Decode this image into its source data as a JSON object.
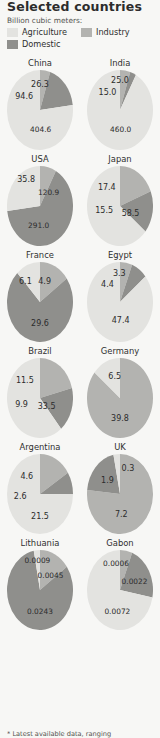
{
  "header": {
    "title": "Selected countries",
    "units_label": "Billion cubic meters:"
  },
  "legend": {
    "items": [
      {
        "label": "Agriculture",
        "key": "agriculture",
        "color": "#e3e3e0"
      },
      {
        "label": "Industry",
        "key": "industry",
        "color": "#b3b3b0"
      },
      {
        "label": "Domestic",
        "key": "domestic",
        "color": "#8f8f8c"
      }
    ]
  },
  "footnote": {
    "text": "* Latest available data, ranging"
  },
  "colors": {
    "background": "#f7f7f5",
    "agriculture": "#e3e3e0",
    "industry": "#b3b3b0",
    "domestic": "#8f8f8c",
    "text": "#2c2c2c"
  },
  "chart_data": {
    "type": "pie",
    "title": "Selected countries",
    "unit": "Billion cubic meters",
    "categories": [
      "Agriculture",
      "Industry",
      "Domestic"
    ],
    "legend_position": "top",
    "charts": [
      {
        "name": "China",
        "labels": [
          {
            "text": "26.3",
            "series": "industry",
            "x": 50,
            "y": 17
          },
          {
            "text": "94.6",
            "series": "domestic",
            "x": 26,
            "y": 33
          },
          {
            "text": "404.6",
            "series": "agriculture",
            "x": 51,
            "y": 74
          }
        ],
        "values": {
          "agriculture": 404.6,
          "industry": 26.3,
          "domestic": 94.6
        }
      },
      {
        "name": "India",
        "labels": [
          {
            "text": "25.0",
            "series": "industry",
            "x": 50,
            "y": 13
          },
          {
            "text": "15.0",
            "series": "domestic",
            "x": 31,
            "y": 28
          },
          {
            "text": "460.0",
            "series": "agriculture",
            "x": 51,
            "y": 74
          }
        ],
        "values": {
          "agriculture": 460.0,
          "industry": 25.0,
          "domestic": 15.0
        }
      },
      {
        "name": "USA",
        "labels": [
          {
            "text": "35.8",
            "series": "industry",
            "x": 29,
            "y": 16
          },
          {
            "text": "120.9",
            "series": "agriculture",
            "x": 63,
            "y": 33
          },
          {
            "text": "291.0",
            "series": "domestic",
            "x": 48,
            "y": 74
          }
        ],
        "values": {
          "agriculture": 120.9,
          "industry": 35.8,
          "domestic": 291.0
        }
      },
      {
        "name": "Japan",
        "labels": [
          {
            "text": "17.4",
            "series": "industry",
            "x": 30,
            "y": 26
          },
          {
            "text": "15.5",
            "series": "domestic",
            "x": 26,
            "y": 55
          },
          {
            "text": "58.5",
            "series": "agriculture",
            "x": 66,
            "y": 59
          }
        ],
        "values": {
          "agriculture": 58.5,
          "industry": 17.4,
          "domestic": 15.5
        }
      },
      {
        "name": "France",
        "labels": [
          {
            "text": "6.1",
            "series": "industry",
            "x": 28,
            "y": 24
          },
          {
            "text": "4.9",
            "series": "agriculture",
            "x": 57,
            "y": 24
          },
          {
            "text": "29.6",
            "series": "domestic",
            "x": 50,
            "y": 76
          }
        ],
        "values": {
          "agriculture": 4.9,
          "industry": 6.1,
          "domestic": 29.6
        }
      },
      {
        "name": "Egypt",
        "labels": [
          {
            "text": "3.3",
            "series": "industry",
            "x": 49,
            "y": 14
          },
          {
            "text": "4.4",
            "series": "domestic",
            "x": 31,
            "y": 27
          },
          {
            "text": "47.4",
            "series": "agriculture",
            "x": 51,
            "y": 73
          }
        ],
        "values": {
          "agriculture": 47.4,
          "industry": 3.3,
          "domestic": 4.4
        }
      },
      {
        "name": "Brazil",
        "labels": [
          {
            "text": "11.5",
            "series": "industry",
            "x": 27,
            "y": 28
          },
          {
            "text": "9.9",
            "series": "domestic",
            "x": 22,
            "y": 58
          },
          {
            "text": "33.5",
            "series": "agriculture",
            "x": 60,
            "y": 60
          }
        ],
        "values": {
          "agriculture": 33.5,
          "industry": 11.5,
          "domestic": 9.9
        }
      },
      {
        "name": "Germany",
        "labels": [
          {
            "text": "6.5",
            "series": "agriculture",
            "x": 42,
            "y": 22
          },
          {
            "text": "39.8",
            "series": "industry",
            "x": 50,
            "y": 75
          }
        ],
        "values": {
          "agriculture": 6.5,
          "industry": 39.8,
          "domestic": null
        }
      },
      {
        "name": "Argentina",
        "labels": [
          {
            "text": "4.6",
            "series": "industry",
            "x": 30,
            "y": 27
          },
          {
            "text": "2.6",
            "series": "domestic",
            "x": 20,
            "y": 52
          },
          {
            "text": "21.5",
            "series": "agriculture",
            "x": 50,
            "y": 77
          }
        ],
        "values": {
          "agriculture": 21.5,
          "industry": 4.6,
          "domestic": 2.6
        }
      },
      {
        "name": "UK",
        "labels": [
          {
            "text": "0.3",
            "series": "agriculture",
            "x": 62,
            "y": 18
          },
          {
            "text": "1.9",
            "series": "domestic",
            "x": 31,
            "y": 33
          },
          {
            "text": "7.2",
            "series": "industry",
            "x": 52,
            "y": 75
          }
        ],
        "values": {
          "agriculture": 0.3,
          "industry": 7.2,
          "domestic": 1.9
        }
      },
      {
        "name": "Lithuania",
        "labels": [
          {
            "text": "0.0009",
            "series": "agriculture",
            "x": 46,
            "y": 13
          },
          {
            "text": "0.0045",
            "series": "industry",
            "x": 66,
            "y": 31
          },
          {
            "text": "0.0243",
            "series": "domestic",
            "x": 50,
            "y": 76
          }
        ],
        "values": {
          "agriculture": 0.0009,
          "industry": 0.0045,
          "domestic": 0.0243
        }
      },
      {
        "name": "Gabon",
        "labels": [
          {
            "text": "0.0006",
            "series": "agriculture",
            "x": 44,
            "y": 16
          },
          {
            "text": "0.0022",
            "series": "industry",
            "x": 72,
            "y": 39
          },
          {
            "text": "0.0072",
            "series": "domestic",
            "x": 46,
            "y": 76
          }
        ],
        "values": {
          "agriculture": 0.0072,
          "industry": 0.0006,
          "domestic": 0.0022
        }
      }
    ]
  }
}
